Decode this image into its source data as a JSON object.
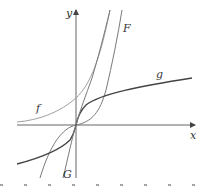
{
  "diagram": {
    "title": "",
    "axes": {
      "x_label": "x",
      "y_label": "y",
      "origin_px": [
        76,
        125
      ]
    },
    "curves": [
      {
        "name": "f",
        "label": "f",
        "description": "exponential-like curve, increasing, positive, asymptotic to x-axis on left",
        "color": "#9a9a9a"
      },
      {
        "name": "F",
        "label": "F",
        "description": "cubic-like curve through origin, flat at origin, steep on both sides",
        "color": "#777777"
      },
      {
        "name": "g",
        "label": "g",
        "description": "arctan-like curve through origin, flattening on both ends",
        "color": "#444444"
      },
      {
        "name": "G",
        "label": "G",
        "description": "steep increasing curve through origin",
        "color": "#777777"
      }
    ],
    "colors": {
      "axis": "#555555",
      "background": "#ffffff"
    }
  }
}
